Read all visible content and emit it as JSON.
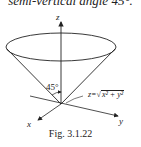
{
  "header": {
    "clipped_text": "semi-vertical angle 45°."
  },
  "diagram": {
    "axes": {
      "z_label": "z",
      "x_label": "x",
      "y_label": "y"
    },
    "angle_label": "45°",
    "equation": {
      "lhs": "z=",
      "radicand": "x² + y²"
    },
    "surface": "cone"
  },
  "caption": "Fig.  3.1.22",
  "colors": {
    "line": "#222222",
    "background": "#ffffff"
  }
}
